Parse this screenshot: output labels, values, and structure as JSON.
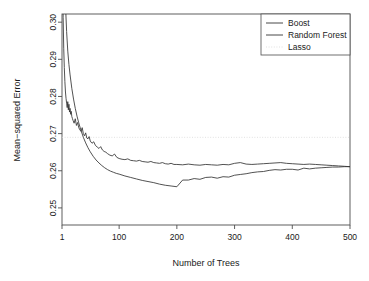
{
  "chart_data": {
    "type": "line",
    "title": "",
    "xlabel": "Number of Trees",
    "ylabel": "Mean−squared Error",
    "xlim": [
      1,
      500
    ],
    "ylim": [
      0.2454,
      0.3022
    ],
    "grid": false,
    "legend_position": "top-right",
    "xticks": [
      1,
      100,
      200,
      300,
      400,
      500
    ],
    "xtick_labels": [
      "1",
      "100",
      "200",
      "300",
      "400",
      "500"
    ],
    "yticks": [
      0.25,
      0.26,
      0.27,
      0.28,
      0.29,
      0.3
    ],
    "ytick_labels": [
      "0.25",
      "0.26",
      "0.27",
      "0.28",
      "0.29",
      "0.30"
    ],
    "legend": [
      {
        "name": "Boost",
        "style": "solid",
        "color": "#333333"
      },
      {
        "name": "Random Forest",
        "style": "solid",
        "color": "#333333"
      },
      {
        "name": "Lasso",
        "style": "dotted",
        "color": "#d9d9d9"
      }
    ],
    "series": [
      {
        "name": "Boost",
        "style": "solid",
        "color": "#333333",
        "x": [
          1,
          3,
          5,
          7,
          9,
          11,
          13,
          15,
          18,
          21,
          24,
          27,
          30,
          34,
          38,
          42,
          46,
          50,
          55,
          60,
          65,
          70,
          75,
          80,
          85,
          90,
          95,
          100,
          110,
          120,
          130,
          140,
          150,
          160,
          170,
          180,
          190,
          200,
          210,
          220,
          230,
          240,
          250,
          260,
          270,
          280,
          290,
          300,
          310,
          320,
          330,
          340,
          350,
          360,
          370,
          380,
          390,
          400,
          410,
          420,
          430,
          440,
          450,
          460,
          470,
          480,
          490,
          500
        ],
        "y": [
          0.348,
          0.33,
          0.316,
          0.3048,
          0.2975,
          0.2922,
          0.2886,
          0.2858,
          0.2822,
          0.2793,
          0.2768,
          0.2747,
          0.2729,
          0.2708,
          0.269,
          0.2675,
          0.2662,
          0.2651,
          0.2639,
          0.2629,
          0.2621,
          0.2614,
          0.2608,
          0.2603,
          0.2599,
          0.2596,
          0.2593,
          0.2591,
          0.2586,
          0.2582,
          0.2578,
          0.2574,
          0.2571,
          0.2568,
          0.2564,
          0.2561,
          0.2559,
          0.2557,
          0.2575,
          0.2575,
          0.2579,
          0.2577,
          0.2582,
          0.2583,
          0.258,
          0.2584,
          0.2583,
          0.2588,
          0.259,
          0.2592,
          0.2595,
          0.2597,
          0.2598,
          0.2601,
          0.2603,
          0.2602,
          0.2604,
          0.2604,
          0.2602,
          0.2607,
          0.2605,
          0.2607,
          0.2608,
          0.2609,
          0.261,
          0.261,
          0.2611,
          0.2611
        ]
      },
      {
        "name": "Random Forest",
        "style": "solid",
        "color": "#333333",
        "x": [
          1,
          2,
          3,
          4,
          5,
          6,
          7,
          8,
          9,
          10,
          11,
          12,
          13,
          14,
          15,
          16,
          17,
          18,
          19,
          20,
          22,
          24,
          26,
          28,
          30,
          32,
          34,
          36,
          38,
          40,
          42,
          44,
          46,
          48,
          50,
          53,
          56,
          59,
          62,
          65,
          68,
          71,
          74,
          77,
          80,
          84,
          88,
          92,
          96,
          100,
          105,
          110,
          115,
          120,
          125,
          130,
          135,
          140,
          145,
          150,
          155,
          160,
          165,
          170,
          175,
          180,
          185,
          190,
          195,
          200,
          210,
          220,
          230,
          240,
          250,
          260,
          270,
          280,
          290,
          300,
          310,
          320,
          330,
          340,
          350,
          360,
          370,
          380,
          390,
          400,
          410,
          420,
          430,
          440,
          450,
          460,
          470,
          480,
          490,
          500
        ],
        "y": [
          0.352,
          0.317,
          0.3012,
          0.293,
          0.2878,
          0.284,
          0.2812,
          0.2795,
          0.2782,
          0.277,
          0.2786,
          0.2764,
          0.2779,
          0.2758,
          0.2768,
          0.2752,
          0.276,
          0.2746,
          0.2741,
          0.2736,
          0.2728,
          0.274,
          0.2722,
          0.273,
          0.2716,
          0.271,
          0.2706,
          0.2716,
          0.27,
          0.2694,
          0.2702,
          0.2688,
          0.2686,
          0.2692,
          0.268,
          0.2674,
          0.2678,
          0.2668,
          0.2664,
          0.266,
          0.2665,
          0.2656,
          0.2652,
          0.265,
          0.2646,
          0.2642,
          0.264,
          0.2645,
          0.2636,
          0.2633,
          0.2631,
          0.263,
          0.2632,
          0.2628,
          0.2627,
          0.2626,
          0.2628,
          0.2625,
          0.2624,
          0.2623,
          0.2625,
          0.2622,
          0.2621,
          0.262,
          0.2622,
          0.2619,
          0.2618,
          0.262,
          0.2617,
          0.2617,
          0.2616,
          0.2618,
          0.2616,
          0.2615,
          0.2617,
          0.2616,
          0.2615,
          0.2617,
          0.2616,
          0.262,
          0.2622,
          0.2618,
          0.2617,
          0.2618,
          0.2619,
          0.262,
          0.2621,
          0.2622,
          0.262,
          0.2619,
          0.2618,
          0.2617,
          0.2618,
          0.2617,
          0.2616,
          0.2615,
          0.2614,
          0.2613,
          0.2612,
          0.2611
        ]
      }
    ],
    "reference_lines": [
      {
        "name": "Lasso",
        "orientation": "horizontal",
        "value": 0.269,
        "style": "dotted",
        "color": "#d9d9d9"
      }
    ]
  }
}
